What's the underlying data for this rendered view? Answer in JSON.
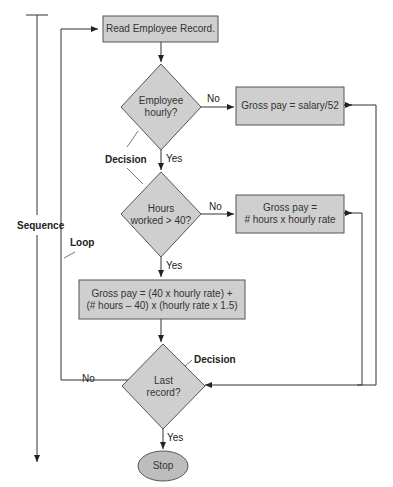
{
  "colors": {
    "fill": "#cfcfcf",
    "stroke": "#555555",
    "line": "#333333",
    "background": "#ffffff"
  },
  "nodes": {
    "read": {
      "shape": "rectangle",
      "text": "Read Employee Record."
    },
    "hourly": {
      "shape": "diamond",
      "line1": "Employee",
      "line2": "hourly?"
    },
    "salary": {
      "shape": "rectangle",
      "text": "Gross pay = salary/52"
    },
    "hours40": {
      "shape": "diamond",
      "line1": "Hours",
      "line2": "worked > 40?"
    },
    "regular": {
      "shape": "rectangle",
      "line1": "Gross pay =",
      "line2": "# hours x hourly rate"
    },
    "overtime": {
      "shape": "rectangle",
      "line1": "Gross pay = (40 x hourly rate) +",
      "line2": "(# hours – 40) x (hourly rate x 1.5)"
    },
    "last": {
      "shape": "diamond",
      "line1": "Last",
      "line2": "record?"
    },
    "stop": {
      "shape": "ellipse",
      "text": "Stop"
    }
  },
  "edge_labels": {
    "hourly_no": "No",
    "hourly_yes": "Yes",
    "hours_no": "No",
    "hours_yes": "Yes",
    "last_no": "No",
    "last_yes": "Yes"
  },
  "annotations": {
    "decision1": "Decision",
    "decision2": "Decision",
    "sequence": "Sequence",
    "loop": "Loop"
  }
}
